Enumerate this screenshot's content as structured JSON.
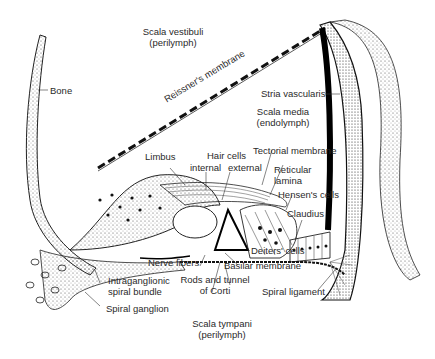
{
  "diagram": {
    "regions": {
      "scala_vestibuli": [
        "Scala vestibuli",
        "(perilymph)"
      ],
      "scala_media": [
        "Scala media",
        "(endolymph)"
      ],
      "scala_tympani": [
        "Scala tympani",
        "(perilymph)"
      ]
    },
    "labels": {
      "bone": "Bone",
      "reissners_membrane": "Reissner's membrane",
      "stria_vascularis": "Stria vascularis",
      "limbus": "Limbus",
      "hair_cells": "Hair cells",
      "internal": "internal",
      "external": "external",
      "tectorial_membrane": "Tectorial membrane",
      "reticular_lamina": [
        "Reticular",
        "lamina"
      ],
      "hensens_cells": "Hensen's cells",
      "claudius": "Claudius",
      "deiters_cells": "Deiters' cells",
      "nerve_fibers": "Nerve fibers",
      "basilar_membrane": "Basilar membrane",
      "rods_tunnel": [
        "Rods and tunnel",
        "of Corti"
      ],
      "intraganglionic": [
        "Intraganglionic",
        "spiral bundle"
      ],
      "spiral_ganglion": "Spiral ganglion",
      "spiral_ligament": "Spiral ligament"
    },
    "colors": {
      "ink": "#1a1a1a",
      "background": "#ffffff"
    }
  }
}
